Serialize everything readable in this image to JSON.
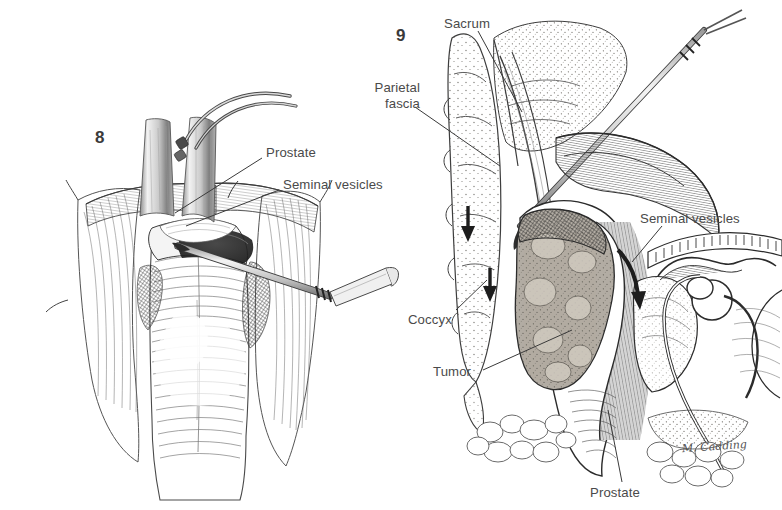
{
  "plate": {
    "kind": "medical-illustration",
    "background_color": "#ffffff",
    "ink_color": "#2b2b2b",
    "label_color": "#4a4a4a",
    "tumor_tone": "#a9a49c",
    "shadow_tone": "#6d6a66"
  },
  "figures": [
    {
      "id": "fig-8",
      "number": "8",
      "number_pos": {
        "x": 95,
        "y": 128
      },
      "description": "Operative field view of exposed prostate and seminal vesicles with retractors and dissecting instrument",
      "labels": [
        {
          "name": "prostate",
          "text": "Prostate",
          "pos": {
            "x": 266,
            "y": 145
          },
          "leader": {
            "x1": 262,
            "y1": 158,
            "x2": 175,
            "y2": 213
          }
        },
        {
          "name": "seminal-vesicles",
          "text": "Seminal vesicles",
          "pos": {
            "x": 283,
            "y": 177
          },
          "leader": {
            "x1": 279,
            "y1": 190,
            "x2": 186,
            "y2": 226
          }
        }
      ]
    },
    {
      "id": "fig-9",
      "number": "9",
      "number_pos": {
        "x": 396,
        "y": 26
      },
      "description": "Sagittal section through sacrum, coccyx, rectum with tumor, prostate and seminal vesicles showing posterior surgical approach",
      "labels": [
        {
          "name": "sacrum",
          "text": "Sacrum",
          "pos": {
            "x": 444,
            "y": 16
          },
          "leader": {
            "x1": 478,
            "y1": 31,
            "x2": 522,
            "y2": 112
          }
        },
        {
          "name": "parietal-fascia",
          "text": "Parietal\nfascia",
          "pos": {
            "x": 364,
            "y": 80
          },
          "leader": {
            "x1": 415,
            "y1": 107,
            "x2": 500,
            "y2": 166
          }
        },
        {
          "name": "seminal-vesicles",
          "text": "Seminal vesicles",
          "pos": {
            "x": 640,
            "y": 211
          },
          "leader": {
            "x1": 662,
            "y1": 226,
            "x2": 632,
            "y2": 262
          }
        },
        {
          "name": "coccyx",
          "text": "Coccyx",
          "pos": {
            "x": 408,
            "y": 312
          },
          "leader": {
            "x1": 456,
            "y1": 310,
            "x2": 487,
            "y2": 280
          }
        },
        {
          "name": "tumor",
          "text": "Tumor",
          "pos": {
            "x": 433,
            "y": 364
          },
          "leader": {
            "x1": 483,
            "y1": 370,
            "x2": 572,
            "y2": 330
          }
        },
        {
          "name": "prostate",
          "text": "Prostate",
          "pos": {
            "x": 590,
            "y": 485
          },
          "leader": {
            "x1": 622,
            "y1": 482,
            "x2": 608,
            "y2": 410
          }
        }
      ],
      "arrows": [
        {
          "name": "arrow-fascia-down",
          "x": 470,
          "y": 222,
          "angle": 96
        },
        {
          "name": "arrow-coccyx-down",
          "x": 492,
          "y": 282,
          "angle": 96
        },
        {
          "name": "arrow-vesicle-curved",
          "x": 630,
          "y": 268,
          "angle": 70
        }
      ]
    }
  ],
  "signature": {
    "name": "artist-signature",
    "text": "M. Cadding",
    "pos": {
      "x": 682,
      "y": 440
    }
  }
}
